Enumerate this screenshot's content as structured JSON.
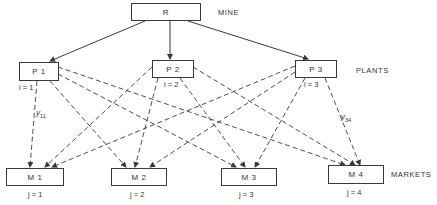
{
  "diagram": {
    "type": "network-flow",
    "levels": {
      "mine": "MINE",
      "plants": "PLANTS",
      "markets": "MARKETS"
    },
    "mine": {
      "label": "R"
    },
    "plants": [
      {
        "label": "P 1",
        "index": "i = 1"
      },
      {
        "label": "P 2",
        "index": "i = 2"
      },
      {
        "label": "P 3",
        "index": "i = 3"
      }
    ],
    "markets": [
      {
        "label": "M 1",
        "index": "j = 1"
      },
      {
        "label": "M 2",
        "index": "j = 2"
      },
      {
        "label": "M 3",
        "index": "j = 3"
      },
      {
        "label": "M 4",
        "index": "j = 4"
      }
    ],
    "flow_labels": [
      {
        "var": "y",
        "sub": "11"
      },
      {
        "var": "y",
        "sub": "34"
      }
    ],
    "edges": {
      "solid": [
        [
          "R",
          "P1"
        ],
        [
          "R",
          "P2"
        ],
        [
          "R",
          "P3"
        ]
      ],
      "dashed": [
        [
          "P1",
          "M1"
        ],
        [
          "P1",
          "M2"
        ],
        [
          "P1",
          "M3"
        ],
        [
          "P1",
          "M4"
        ],
        [
          "P2",
          "M1"
        ],
        [
          "P2",
          "M2"
        ],
        [
          "P2",
          "M3"
        ],
        [
          "P2",
          "M4"
        ],
        [
          "P3",
          "M1"
        ],
        [
          "P3",
          "M2"
        ],
        [
          "P3",
          "M3"
        ],
        [
          "P3",
          "M4"
        ]
      ]
    },
    "colors": {
      "line": "#3a3a3a",
      "text": "#333333",
      "background": "#ffffff"
    }
  }
}
